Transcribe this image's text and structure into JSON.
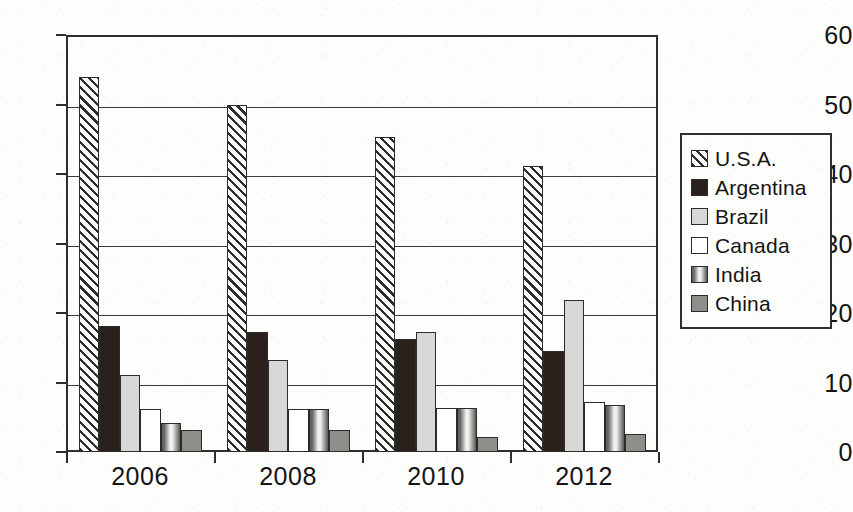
{
  "chart_data": {
    "type": "bar",
    "title": "",
    "xlabel": "",
    "ylabel": "",
    "categories": [
      "2006",
      "2008",
      "2010",
      "2012"
    ],
    "ylim": [
      0,
      60
    ],
    "yticks": [
      0,
      10,
      20,
      30,
      40,
      50,
      60
    ],
    "grid": true,
    "legend_position": "right",
    "series": [
      {
        "name": "U.S.A.",
        "pattern": "diagonal-hatch",
        "color": "#fbfbf9",
        "values": [
          54,
          50,
          45.3,
          41.2
        ]
      },
      {
        "name": "Argentina",
        "pattern": "solid-dark",
        "color": "#2a211d",
        "values": [
          18.2,
          17.2,
          16.3,
          14.5
        ]
      },
      {
        "name": "Brazil",
        "pattern": "solid-light-gray",
        "color": "#d7d7d5",
        "values": [
          11.1,
          13.2,
          17.3,
          21.9
        ]
      },
      {
        "name": "Canada",
        "pattern": "solid-white",
        "color": "#ffffff",
        "values": [
          6.2,
          6.2,
          6.3,
          7.2
        ]
      },
      {
        "name": "India",
        "pattern": "vertical-gradient",
        "color": "#9c9c99",
        "values": [
          4.2,
          6.2,
          6.4,
          6.8
        ]
      },
      {
        "name": "China",
        "pattern": "solid-mid-gray",
        "color": "#8e8e8b",
        "values": [
          3.1,
          3.1,
          2.2,
          2.6
        ]
      }
    ]
  },
  "legend": {
    "items": [
      {
        "label": "U.S.A.",
        "swatch": "swatch-usa-hatched"
      },
      {
        "label": "Argentina",
        "swatch": "swatch-argentina-dark"
      },
      {
        "label": "Brazil",
        "swatch": "swatch-brazil-light-gray"
      },
      {
        "label": "Canada",
        "swatch": "swatch-canada-white"
      },
      {
        "label": "India",
        "swatch": "swatch-india-gradient"
      },
      {
        "label": "China",
        "swatch": "swatch-china-gray"
      }
    ]
  },
  "axes": {
    "y_tick_labels": [
      "0",
      "10",
      "20",
      "30",
      "40",
      "50",
      "60"
    ],
    "x_tick_labels": [
      "2006",
      "2008",
      "2010",
      "2012"
    ]
  }
}
